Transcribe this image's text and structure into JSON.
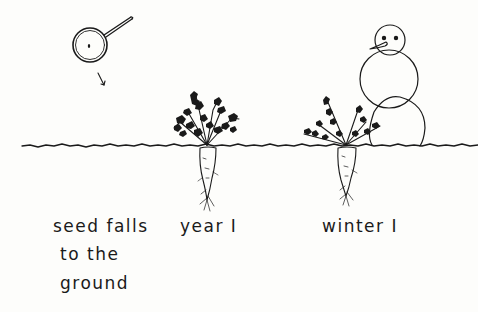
{
  "diagram": {
    "colors": {
      "ink": "#1a1a1a",
      "paper": "#fdfdfb"
    },
    "stages": [
      {
        "id": "seed",
        "label_lines": [
          "seed falls",
          "to the",
          "ground"
        ],
        "illustration": "magnifier-with-seed"
      },
      {
        "id": "year1",
        "label": "year I",
        "illustration": "carrot-plant"
      },
      {
        "id": "winter1",
        "label": "winter I",
        "illustration": "carrot-plant-with-snowman"
      }
    ]
  }
}
